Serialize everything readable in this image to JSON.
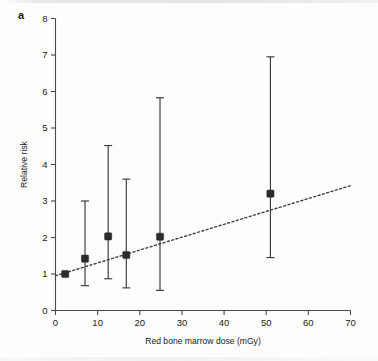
{
  "figure": {
    "panel_label": "a"
  },
  "chart_data": {
    "type": "scatter",
    "title": "",
    "xlabel": "Red bone marrow dose (mGy)",
    "ylabel": "Relative risk",
    "xlim": [
      0,
      70
    ],
    "ylim": [
      0,
      8
    ],
    "xticks": [
      0,
      10,
      20,
      30,
      40,
      50,
      60,
      70
    ],
    "xtick_labels": [
      "0",
      "10",
      "20",
      "30",
      "40",
      "50",
      "60",
      "70"
    ],
    "yticks": [
      0,
      1,
      2,
      3,
      4,
      5,
      6,
      7,
      8
    ],
    "ytick_labels": [
      "0",
      "1",
      "2",
      "3",
      "4",
      "5",
      "6",
      "7",
      "8"
    ],
    "grid": false,
    "legend": null,
    "marker_style": "filled-square",
    "error_bar_style": "vertical-capped",
    "points": [
      {
        "x": 2.3,
        "y": 1.0,
        "ci_low": 1.0,
        "ci_high": 1.0
      },
      {
        "x": 7.0,
        "y": 1.42,
        "ci_low": 0.68,
        "ci_high": 3.0
      },
      {
        "x": 12.5,
        "y": 2.03,
        "ci_low": 0.87,
        "ci_high": 4.52
      },
      {
        "x": 16.8,
        "y": 1.52,
        "ci_low": 0.62,
        "ci_high": 3.6
      },
      {
        "x": 24.8,
        "y": 2.02,
        "ci_low": 0.55,
        "ci_high": 5.83
      },
      {
        "x": 51.0,
        "y": 3.2,
        "ci_low": 1.45,
        "ci_high": 6.95
      }
    ],
    "trendline": {
      "style": "dotted",
      "x_start": 0.0,
      "y_start": 0.95,
      "x_end": 70.0,
      "y_end": 3.42
    },
    "colors": {
      "marker": "#2b2b2b",
      "error_bar": "#3a3a3a",
      "axis": "#4a4a4a",
      "trendline": "#3b3b3b",
      "text": "#1b1b1b",
      "background": "#fdfdfc"
    }
  }
}
